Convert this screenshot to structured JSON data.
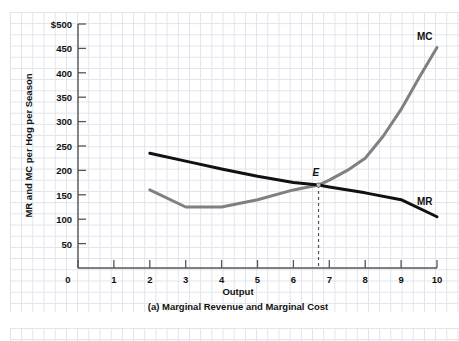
{
  "chart_data": {
    "type": "line",
    "title": "",
    "caption": "(a) Marginal Revenue and Marginal Cost",
    "xlabel": "Output",
    "ylabel": "MR and MC per Hog per Season",
    "xlim": [
      0,
      10.6
    ],
    "ylim": [
      0,
      500
    ],
    "grid": true,
    "legend_position": "inline-right",
    "x_ticks": [
      "0",
      "1",
      "2",
      "3",
      "4",
      "5",
      "6",
      "7",
      "8",
      "9",
      "10"
    ],
    "y_ticks": [
      "50",
      "100",
      "150",
      "200",
      "250",
      "300",
      "350",
      "400",
      "450",
      "$500"
    ],
    "series": [
      {
        "name": "MR",
        "label": "MR",
        "color": "#111111",
        "width": 3.0,
        "x": [
          2,
          3,
          4,
          5,
          6,
          6.7,
          7,
          8,
          9,
          10
        ],
        "values": [
          235,
          219,
          203,
          188,
          175,
          170,
          166,
          154,
          140,
          105
        ]
      },
      {
        "name": "MC",
        "label": "MC",
        "color": "#808080",
        "width": 3.0,
        "x": [
          2,
          3,
          4,
          5,
          6,
          6.7,
          7,
          7.5,
          8,
          8.5,
          9,
          9.5,
          10
        ],
        "values": [
          160,
          125,
          125,
          140,
          160,
          170,
          180,
          200,
          225,
          270,
          325,
          390,
          452
        ]
      }
    ],
    "annotations": [
      {
        "name": "equilibrium-point",
        "label": "E",
        "x": 6.7,
        "y": 170,
        "dropline": true,
        "dropline_to_y": 0,
        "dropline_style": "dashed"
      }
    ],
    "colors": {
      "mr": "#111111",
      "mc": "#808080",
      "axis": "#555555",
      "grid": "#dfe3ea",
      "text": "#111111",
      "background": "#ffffff"
    }
  }
}
